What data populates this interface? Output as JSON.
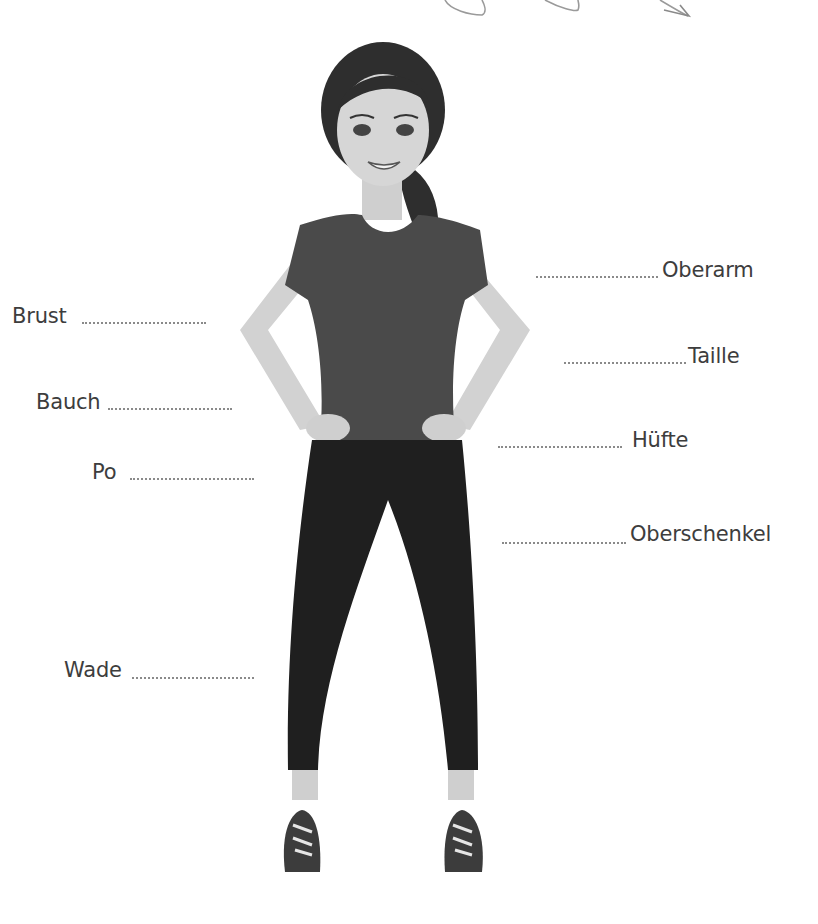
{
  "worksheet": {
    "labels_left": [
      {
        "id": "brust",
        "text": "Brust"
      },
      {
        "id": "bauch",
        "text": "Bauch"
      },
      {
        "id": "po",
        "text": "Po"
      },
      {
        "id": "wade",
        "text": "Wade"
      }
    ],
    "labels_right": [
      {
        "id": "oberarm",
        "text": "Oberarm"
      },
      {
        "id": "taille",
        "text": "Taille"
      },
      {
        "id": "huefte",
        "text": "Hüfte"
      },
      {
        "id": "oberschenkel",
        "text": "Oberschenkel"
      }
    ],
    "colors": {
      "text": "#3d3d3d",
      "dots": "#8a8a8a",
      "hair": "#2e2e2e",
      "skin": "#d4d4d4",
      "shirt": "#4a4a4a",
      "leggings": "#1f1f1f",
      "background": "#ffffff"
    }
  }
}
